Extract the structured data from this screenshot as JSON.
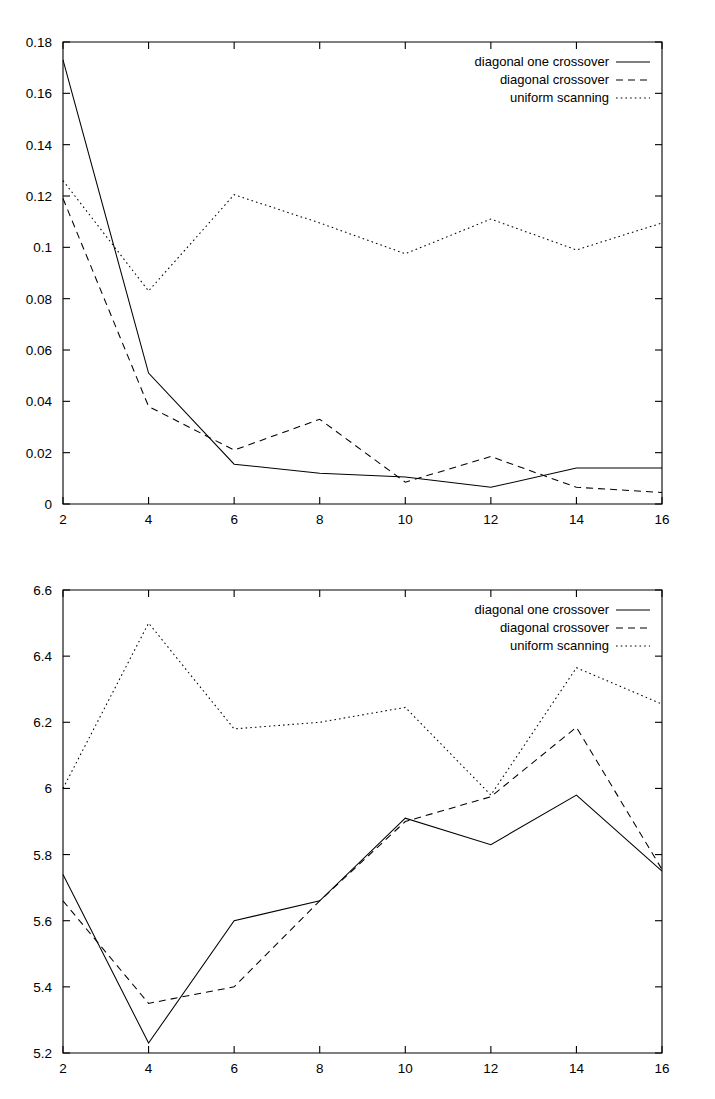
{
  "chart_data": [
    {
      "id": "top",
      "type": "line",
      "title": "",
      "subtitle": "",
      "xlabel": "",
      "ylabel": "",
      "xlim": [
        2,
        16
      ],
      "ylim": [
        0,
        0.18
      ],
      "grid": false,
      "legend_position": "top-right",
      "x": [
        2,
        4,
        6,
        8,
        10,
        12,
        14,
        16
      ],
      "xticks": [
        "2",
        "4",
        "6",
        "8",
        "10",
        "12",
        "14",
        "16"
      ],
      "yticks": [
        "0",
        "0.02",
        "0.04",
        "0.06",
        "0.08",
        "0.1",
        "0.12",
        "0.14",
        "0.16",
        "0.18"
      ],
      "ytick_values": [
        0,
        0.02,
        0.04,
        0.06,
        0.08,
        0.1,
        0.12,
        0.14,
        0.16,
        0.18
      ],
      "series": [
        {
          "name": "diagonal one crossover",
          "style": "solid",
          "values": [
            0.173,
            0.051,
            0.0155,
            0.012,
            0.0105,
            0.0065,
            0.014,
            0.014
          ]
        },
        {
          "name": "diagonal crossover",
          "style": "dashed",
          "values": [
            0.119,
            0.038,
            0.021,
            0.033,
            0.0085,
            0.0185,
            0.0065,
            0.0045
          ]
        },
        {
          "name": "uniform scanning",
          "style": "dotted",
          "values": [
            0.126,
            0.083,
            0.1205,
            0.1095,
            0.0975,
            0.111,
            0.099,
            0.1095
          ]
        }
      ]
    },
    {
      "id": "bottom",
      "type": "line",
      "title": "",
      "subtitle": "",
      "xlabel": "",
      "ylabel": "",
      "xlim": [
        2,
        16
      ],
      "ylim": [
        5.2,
        6.6
      ],
      "grid": false,
      "legend_position": "top-right",
      "x": [
        2,
        4,
        6,
        8,
        10,
        12,
        14,
        16
      ],
      "xticks": [
        "2",
        "4",
        "6",
        "8",
        "10",
        "12",
        "14",
        "16"
      ],
      "yticks": [
        "5.2",
        "5.4",
        "5.6",
        "5.8",
        "6",
        "6.2",
        "6.4",
        "6.6"
      ],
      "ytick_values": [
        5.2,
        5.4,
        5.6,
        5.8,
        6.0,
        6.2,
        6.4,
        6.6
      ],
      "series": [
        {
          "name": "diagonal one crossover",
          "style": "solid",
          "values": [
            5.74,
            5.23,
            5.6,
            5.66,
            5.91,
            5.83,
            5.98,
            5.75
          ]
        },
        {
          "name": "diagonal crossover",
          "style": "dashed",
          "values": [
            5.66,
            5.35,
            5.4,
            5.66,
            5.9,
            5.975,
            6.185,
            5.755
          ]
        },
        {
          "name": "uniform scanning",
          "style": "dotted",
          "values": [
            6.0,
            6.5,
            6.18,
            6.2,
            6.245,
            5.98,
            6.365,
            6.255
          ]
        }
      ]
    }
  ],
  "legend": {
    "entries": [
      {
        "label": "diagonal one crossover",
        "style": "solid"
      },
      {
        "label": "diagonal crossover",
        "style": "dashed"
      },
      {
        "label": "uniform scanning",
        "style": "dotted"
      }
    ]
  }
}
